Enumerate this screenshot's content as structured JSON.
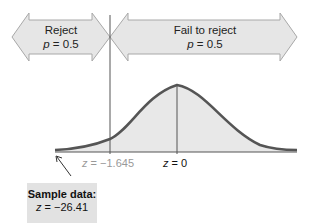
{
  "regions": {
    "reject": {
      "title": "Reject",
      "p_label": "p",
      "p_value": "= 0.5"
    },
    "fail_to_reject": {
      "title": "Fail to reject",
      "p_label": "p",
      "p_value": "= 0.5"
    }
  },
  "axis": {
    "critical": {
      "var": "z",
      "text": "= −1.645"
    },
    "center": {
      "var": "z",
      "text": "= 0"
    }
  },
  "sample": {
    "title": "Sample data:",
    "var": "z",
    "text": "= −26.41"
  },
  "colors": {
    "arrow_fill": "#e6e6e6",
    "arrow_stroke": "#9a9a9a",
    "curve_stroke": "#555555",
    "curve_fill": "#e8e8e8",
    "box_fill": "#e2e2e2"
  }
}
